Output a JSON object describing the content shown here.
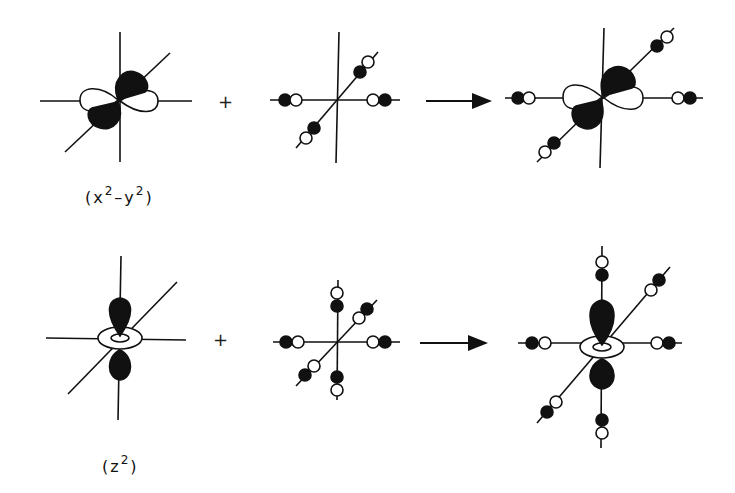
{
  "figure": {
    "rows": [
      {
        "orbital_label_prefix": "(x",
        "orbital_label_sup1": "2",
        "orbital_label_mid": "–y",
        "orbital_label_sup2": "2",
        "orbital_label_suffix": ")",
        "orbital_name": "d(x²−y²)",
        "operator": "+",
        "result": "σ-bonding combination of d(x²−y²) with 4 ligand σ orbitals"
      },
      {
        "orbital_label_prefix": "(z",
        "orbital_label_sup1": "2",
        "orbital_label_suffix": ")",
        "orbital_name": "d(z²)",
        "operator": "+",
        "result": "σ-bonding combination of d(z²) with 6 ligand σ orbitals"
      }
    ],
    "colors": {
      "ink": "#111111",
      "background": "#ffffff"
    }
  }
}
